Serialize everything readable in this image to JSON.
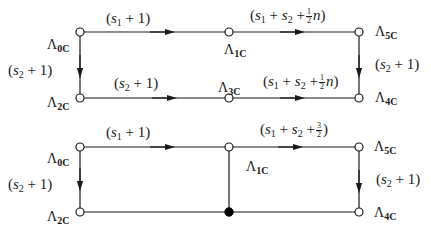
{
  "colors": {
    "line": "#1a1a1a",
    "background": "#ffffff",
    "node_fill_open": "#ffffff",
    "node_fill_closed": "#000000"
  },
  "diagrams": [
    {
      "id": "top",
      "nodes": [
        {
          "id": "L0C",
          "label": "Λ",
          "sub": "0C",
          "x": 80,
          "y": 32,
          "filled": false
        },
        {
          "id": "L1C",
          "label": "Λ",
          "sub": "1C",
          "x": 229,
          "y": 32,
          "filled": false
        },
        {
          "id": "L5C",
          "label": "Λ",
          "sub": "5C",
          "x": 359,
          "y": 32,
          "filled": false
        },
        {
          "id": "L2C",
          "label": "Λ",
          "sub": "2C",
          "x": 80,
          "y": 98,
          "filled": false
        },
        {
          "id": "L3C",
          "label": "Λ",
          "sub": "3C",
          "x": 229,
          "y": 98,
          "filled": false
        },
        {
          "id": "L4C",
          "label": "Λ",
          "sub": "4C",
          "x": 359,
          "y": 98,
          "filled": false
        }
      ],
      "edges": [
        {
          "from": "L0C",
          "to": "L1C",
          "label": "(s1 + 1)"
        },
        {
          "from": "L1C",
          "to": "L5C",
          "label": "(s1 + s2 + ½n)"
        },
        {
          "from": "L0C",
          "to": "L2C",
          "label": "(s2 + 1)"
        },
        {
          "from": "L2C",
          "to": "L3C",
          "label": "(s2 + 1)"
        },
        {
          "from": "L3C",
          "to": "L4C",
          "label": "(s1 + s2 + ½n)"
        },
        {
          "from": "L5C",
          "to": "L4C",
          "label": "(s2 + 1)"
        }
      ]
    },
    {
      "id": "bottom",
      "nodes": [
        {
          "id": "L0C",
          "label": "Λ",
          "sub": "0C",
          "x": 80,
          "y": 147,
          "filled": false
        },
        {
          "id": "L1C",
          "label": "Λ",
          "sub": "1C",
          "x": 229,
          "y": 147,
          "filled": false
        },
        {
          "id": "L5C",
          "label": "Λ",
          "sub": "5C",
          "x": 359,
          "y": 147,
          "filled": false
        },
        {
          "id": "L2C",
          "label": "Λ",
          "sub": "2C",
          "x": 80,
          "y": 212,
          "filled": false
        },
        {
          "id": "J",
          "label": "",
          "sub": "",
          "x": 229,
          "y": 212,
          "filled": true
        },
        {
          "id": "L4C",
          "label": "Λ",
          "sub": "4C",
          "x": 359,
          "y": 212,
          "filled": false
        }
      ],
      "edges": [
        {
          "from": "L0C",
          "to": "L1C",
          "label": "(s1 + 1)"
        },
        {
          "from": "L1C",
          "to": "L5C",
          "label": "(s1 + s2 + 3/2)"
        },
        {
          "from": "L0C",
          "to": "L2C",
          "label": "(s2 + 1)"
        },
        {
          "from": "L5C",
          "to": "L4C",
          "label": "(s2 + 1)"
        },
        {
          "from": "L1C",
          "to": "J",
          "label": ""
        },
        {
          "from": "L2C",
          "to": "J",
          "label": ""
        },
        {
          "from": "J",
          "to": "L4C",
          "label": ""
        }
      ]
    }
  ],
  "text": {
    "lambda": "Λ",
    "s": "s",
    "one": "1",
    "plus": "+",
    "lp": "(",
    "rp": ")",
    "n": "n",
    "half_num": "1",
    "half_den": "2",
    "threehalf_num": "3",
    "threehalf_den": "2",
    "sub1": "1",
    "sub2": "2",
    "sub_0C": "0C",
    "sub_1C": "1C",
    "sub_2C": "2C",
    "sub_3C": "3C",
    "sub_4C": "4C",
    "sub_5C": "5C"
  }
}
